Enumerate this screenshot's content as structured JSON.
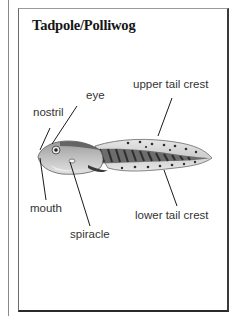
{
  "title": "Tadpole/Polliwog",
  "labels": {
    "eye": "eye",
    "nostril": "nostril",
    "upper_tail_crest": "upper tail crest",
    "mouth": "mouth",
    "spiracle": "spiracle",
    "lower_tail_crest": "lower tail crest"
  },
  "colors": {
    "frame": "#2a2a2a",
    "text": "#333333",
    "body_dark": "#3a3a3a",
    "body_light": "#d8d8d8",
    "tail_light": "#e4e4e4"
  }
}
